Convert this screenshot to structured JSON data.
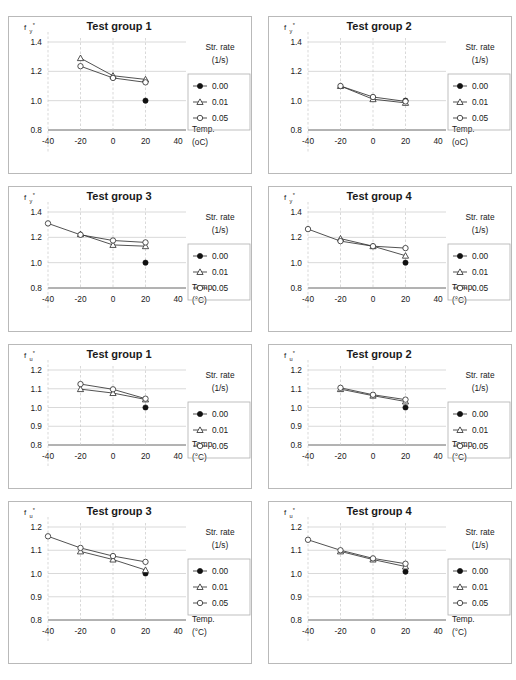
{
  "figure": {
    "legend_title_line1": "Str. rate",
    "legend_title_line2": "(1/s)",
    "legend_items": [
      "0.00",
      "0.01",
      "0.05"
    ],
    "marker_styles": [
      "filled-circle",
      "open-triangle",
      "open-circle"
    ],
    "xlabel": "Temp.",
    "xunit_plain": "(oC)",
    "xunit_degree": "(°C)",
    "xticks": [
      "-40",
      "-20",
      "0",
      "20",
      "40"
    ],
    "accent_color": "#333333",
    "grid_color": "#c8c8c8",
    "frame_color": "#b9b9b9"
  },
  "chart_data": [
    {
      "type": "line",
      "panel_index": 0,
      "title": "Test group 1",
      "ylabel": "f",
      "ylabel_sub": "y",
      "ylabel_star": "*",
      "xlabel": "Temp.",
      "xunit": "(oC)",
      "xlim": [
        -40,
        40
      ],
      "ylim": [
        0.8,
        1.4
      ],
      "yticks": [
        0.8,
        1.0,
        1.2,
        1.4
      ],
      "ytick_labels": [
        "0.8",
        "1.0",
        "1.2",
        "1.4"
      ],
      "xticks": [
        -40,
        -20,
        0,
        20,
        40
      ],
      "grid": true,
      "legend_position": "right",
      "series": [
        {
          "name": "0.00",
          "marker": "filled-circle",
          "x": [
            20
          ],
          "values": [
            1.0
          ]
        },
        {
          "name": "0.01",
          "marker": "open-triangle",
          "x": [
            -20,
            0,
            20
          ],
          "values": [
            1.29,
            1.17,
            1.145
          ]
        },
        {
          "name": "0.05",
          "marker": "open-circle",
          "x": [
            -20,
            0,
            20
          ],
          "values": [
            1.235,
            1.155,
            1.125
          ]
        }
      ]
    },
    {
      "type": "line",
      "panel_index": 1,
      "title": "Test group 2",
      "ylabel": "f",
      "ylabel_sub": "y",
      "ylabel_star": "*",
      "xlabel": "Temp.",
      "xunit": "(oC)",
      "xlim": [
        -40,
        40
      ],
      "ylim": [
        0.8,
        1.4
      ],
      "yticks": [
        0.8,
        1.0,
        1.2,
        1.4
      ],
      "ytick_labels": [
        "0.8",
        "1.0",
        "1.2",
        "1.4"
      ],
      "xticks": [
        -40,
        -20,
        0,
        20,
        40
      ],
      "grid": true,
      "legend_position": "right",
      "series": [
        {
          "name": "0.00",
          "marker": "filled-circle",
          "x": [
            20
          ],
          "values": [
            1.0
          ]
        },
        {
          "name": "0.01",
          "marker": "open-triangle",
          "x": [
            -20,
            0,
            20
          ],
          "values": [
            1.1,
            1.01,
            0.985
          ]
        },
        {
          "name": "0.05",
          "marker": "open-circle",
          "x": [
            -20,
            0,
            20
          ],
          "values": [
            1.1,
            1.025,
            0.995
          ]
        }
      ]
    },
    {
      "type": "line",
      "panel_index": 2,
      "title": "Test group 3",
      "ylabel": "f",
      "ylabel_sub": "y",
      "ylabel_star": "*",
      "xlabel": "Temp.",
      "xunit": "(°C)",
      "xlim": [
        -40,
        40
      ],
      "ylim": [
        0.8,
        1.4
      ],
      "yticks": [
        0.8,
        1.0,
        1.2,
        1.4
      ],
      "ytick_labels": [
        "0.8",
        "1.0",
        "1.2",
        "1.4"
      ],
      "xticks": [
        -40,
        -20,
        0,
        20,
        40
      ],
      "grid": true,
      "legend_position": "right",
      "series": [
        {
          "name": "0.00",
          "marker": "filled-circle",
          "x": [
            20
          ],
          "values": [
            1.0
          ]
        },
        {
          "name": "0.01",
          "marker": "open-triangle",
          "x": [
            -20,
            0,
            20
          ],
          "values": [
            1.225,
            1.14,
            1.13
          ]
        },
        {
          "name": "0.05",
          "marker": "open-circle",
          "x": [
            -40,
            -20,
            0,
            20
          ],
          "values": [
            1.31,
            1.22,
            1.175,
            1.16
          ]
        }
      ]
    },
    {
      "type": "line",
      "panel_index": 3,
      "title": "Test group 4",
      "ylabel": "f",
      "ylabel_sub": "y",
      "ylabel_star": "*",
      "xlabel": "Temp.",
      "xunit": "(°C)",
      "xlim": [
        -40,
        40
      ],
      "ylim": [
        0.8,
        1.4
      ],
      "yticks": [
        0.8,
        1.0,
        1.2,
        1.4
      ],
      "ytick_labels": [
        "0.8",
        "1.0",
        "1.2",
        "1.4"
      ],
      "xticks": [
        -40,
        -20,
        0,
        20,
        40
      ],
      "grid": true,
      "legend_position": "right",
      "series": [
        {
          "name": "0.00",
          "marker": "filled-circle",
          "x": [
            20
          ],
          "values": [
            1.0
          ]
        },
        {
          "name": "0.01",
          "marker": "open-triangle",
          "x": [
            -20,
            0,
            20
          ],
          "values": [
            1.19,
            1.13,
            1.055
          ]
        },
        {
          "name": "0.05",
          "marker": "open-circle",
          "x": [
            -40,
            -20,
            0,
            20
          ],
          "values": [
            1.265,
            1.17,
            1.13,
            1.115
          ]
        }
      ]
    },
    {
      "type": "line",
      "panel_index": 4,
      "title": "Test group 1",
      "ylabel": "f",
      "ylabel_sub": "u",
      "ylabel_star": "*",
      "xlabel": "Temp.",
      "xunit": "(°C)",
      "xlim": [
        -40,
        40
      ],
      "ylim": [
        0.8,
        1.2
      ],
      "yticks": [
        0.8,
        0.9,
        1.0,
        1.1,
        1.2
      ],
      "ytick_labels": [
        "0.8",
        "0.9",
        "1.0",
        "1.1",
        "1.2"
      ],
      "xticks": [
        -40,
        -20,
        0,
        20,
        40
      ],
      "grid": true,
      "legend_position": "right",
      "series": [
        {
          "name": "0.00",
          "marker": "filled-circle",
          "x": [
            20
          ],
          "values": [
            1.0
          ]
        },
        {
          "name": "0.01",
          "marker": "open-triangle",
          "x": [
            -20,
            0,
            20
          ],
          "values": [
            1.098,
            1.077,
            1.043
          ]
        },
        {
          "name": "0.05",
          "marker": "open-circle",
          "x": [
            -20,
            0,
            20
          ],
          "values": [
            1.125,
            1.097,
            1.047
          ]
        }
      ]
    },
    {
      "type": "line",
      "panel_index": 5,
      "title": "Test group 2",
      "ylabel": "f",
      "ylabel_sub": "u",
      "ylabel_star": "*",
      "xlabel": "Temp.",
      "xunit": "(°C)",
      "xlim": [
        -40,
        40
      ],
      "ylim": [
        0.8,
        1.2
      ],
      "yticks": [
        0.8,
        0.9,
        1.0,
        1.1,
        1.2
      ],
      "ytick_labels": [
        "0.8",
        "0.9",
        "1.0",
        "1.1",
        "1.2"
      ],
      "xticks": [
        -40,
        -20,
        0,
        20,
        40
      ],
      "grid": true,
      "legend_position": "right",
      "series": [
        {
          "name": "0.00",
          "marker": "filled-circle",
          "x": [
            20
          ],
          "values": [
            1.0
          ]
        },
        {
          "name": "0.01",
          "marker": "open-triangle",
          "x": [
            -20,
            0,
            20
          ],
          "values": [
            1.098,
            1.063,
            1.032
          ]
        },
        {
          "name": "0.05",
          "marker": "open-circle",
          "x": [
            -20,
            0,
            20
          ],
          "values": [
            1.105,
            1.068,
            1.042
          ]
        }
      ]
    },
    {
      "type": "line",
      "panel_index": 6,
      "title": "Test group 3",
      "ylabel": "f",
      "ylabel_sub": "u",
      "ylabel_star": "*",
      "xlabel": "Temp.",
      "xunit": "(°C)",
      "xlim": [
        -40,
        40
      ],
      "ylim": [
        0.8,
        1.2
      ],
      "yticks": [
        0.8,
        0.9,
        1.0,
        1.1,
        1.2
      ],
      "ytick_labels": [
        "0.8",
        "0.9",
        "1.0",
        "1.1",
        "1.2"
      ],
      "xticks": [
        -40,
        -20,
        0,
        20,
        40
      ],
      "grid": true,
      "legend_position": "right",
      "series": [
        {
          "name": "0.00",
          "marker": "filled-circle",
          "x": [
            20
          ],
          "values": [
            1.0
          ]
        },
        {
          "name": "0.01",
          "marker": "open-triangle",
          "x": [
            -20,
            0,
            20
          ],
          "values": [
            1.095,
            1.06,
            1.015
          ]
        },
        {
          "name": "0.05",
          "marker": "open-circle",
          "x": [
            -40,
            -20,
            0,
            20
          ],
          "values": [
            1.16,
            1.11,
            1.075,
            1.05
          ]
        }
      ]
    },
    {
      "type": "line",
      "panel_index": 7,
      "title": "Test group 4",
      "ylabel": "f",
      "ylabel_sub": "u",
      "ylabel_star": "*",
      "xlabel": "Temp.",
      "xunit": "(°C)",
      "xlim": [
        -40,
        40
      ],
      "ylim": [
        0.8,
        1.2
      ],
      "yticks": [
        0.8,
        0.9,
        1.0,
        1.1,
        1.2
      ],
      "ytick_labels": [
        "0.8",
        "0.9",
        "1.0",
        "1.1",
        "1.2"
      ],
      "xticks": [
        -40,
        -20,
        0,
        20,
        40
      ],
      "grid": true,
      "legend_position": "right",
      "series": [
        {
          "name": "0.00",
          "marker": "filled-circle",
          "x": [
            20
          ],
          "values": [
            1.008
          ]
        },
        {
          "name": "0.01",
          "marker": "open-triangle",
          "x": [
            -20,
            0,
            20
          ],
          "values": [
            1.095,
            1.06,
            1.03
          ]
        },
        {
          "name": "0.05",
          "marker": "open-circle",
          "x": [
            -40,
            -20,
            0,
            20
          ],
          "values": [
            1.145,
            1.1,
            1.065,
            1.042
          ]
        }
      ]
    }
  ]
}
